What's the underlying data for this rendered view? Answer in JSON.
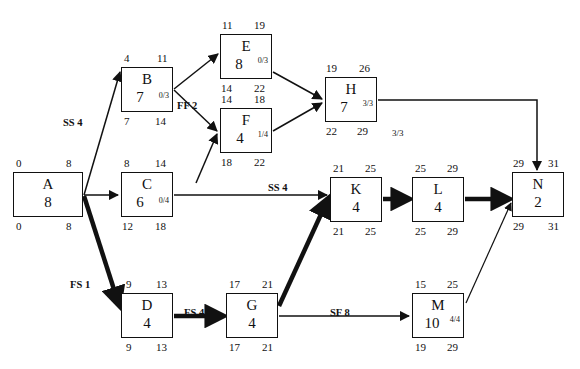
{
  "diagram": {
    "type": "precedence-network-diagram",
    "legend_note": "Each node box shows: Early Start (top-left), Early Finish (top-right), Activity ID, Duration, Free Float/Total Float (small), Late Start (bottom-left), Late Finish (bottom-right)"
  },
  "nodes": [
    {
      "id": "A",
      "name": "A",
      "duration": "8",
      "float": "",
      "es": "0",
      "ef": "8",
      "ls": "0",
      "lf": "8",
      "x": 13,
      "y": 172,
      "w": 70,
      "h": 45
    },
    {
      "id": "B",
      "name": "B",
      "duration": "7",
      "float": "0/3",
      "es": "4",
      "ef": "11",
      "ls": "7",
      "lf": "14",
      "x": 121,
      "y": 67,
      "w": 52,
      "h": 45
    },
    {
      "id": "C",
      "name": "C",
      "duration": "6",
      "float": "0/4",
      "es": "8",
      "ef": "14",
      "ls": "12",
      "lf": "18",
      "x": 121,
      "y": 172,
      "w": 52,
      "h": 45
    },
    {
      "id": "D",
      "name": "D",
      "duration": "4",
      "float": "",
      "es": "9",
      "ef": "13",
      "ls": "9",
      "lf": "13",
      "x": 121,
      "y": 293,
      "w": 52,
      "h": 45
    },
    {
      "id": "E",
      "name": "E",
      "duration": "8",
      "float": "0/3",
      "es": "11",
      "ef": "19",
      "ls": "14",
      "lf": "22",
      "x": 220,
      "y": 34,
      "w": 52,
      "h": 45
    },
    {
      "id": "F",
      "name": "F",
      "duration": "4",
      "float": "1/4",
      "es": "14",
      "ef": "18",
      "ls": "18",
      "lf": "22",
      "x": 220,
      "y": 108,
      "w": 52,
      "h": 45
    },
    {
      "id": "G",
      "name": "G",
      "duration": "4",
      "float": "",
      "es": "17",
      "ef": "21",
      "ls": "17",
      "lf": "21",
      "x": 226,
      "y": 293,
      "w": 52,
      "h": 45
    },
    {
      "id": "H",
      "name": "H",
      "duration": "7",
      "float": "3/3",
      "es": "19",
      "ef": "26",
      "ls": "22",
      "lf": "29",
      "x": 325,
      "y": 77,
      "w": 52,
      "h": 45
    },
    {
      "id": "K",
      "name": "K",
      "duration": "4",
      "float": "",
      "es": "21",
      "ef": "25",
      "ls": "21",
      "lf": "25",
      "x": 330,
      "y": 177,
      "w": 52,
      "h": 45
    },
    {
      "id": "L",
      "name": "L",
      "duration": "4",
      "float": "",
      "es": "25",
      "ef": "29",
      "ls": "25",
      "lf": "29",
      "x": 412,
      "y": 177,
      "w": 52,
      "h": 45
    },
    {
      "id": "M",
      "name": "M",
      "duration": "10",
      "float": "4/4",
      "es": "15",
      "ef": "25",
      "ls": "19",
      "lf": "29",
      "x": 412,
      "y": 293,
      "w": 52,
      "h": 45
    },
    {
      "id": "N",
      "name": "N",
      "duration": "2",
      "float": "",
      "es": "29",
      "ef": "31",
      "ls": "29",
      "lf": "31",
      "x": 512,
      "y": 172,
      "w": 52,
      "h": 45
    }
  ],
  "edge_labels": [
    {
      "key": "a_b",
      "text": "SS 4",
      "x": 63,
      "y": 117
    },
    {
      "key": "b_f",
      "text": "FF 2",
      "x": 177,
      "y": 100
    },
    {
      "key": "a_d",
      "text": "FS 1",
      "x": 70,
      "y": 279
    },
    {
      "key": "d_g",
      "text": "FS 4",
      "x": 184,
      "y": 307
    },
    {
      "key": "c_k",
      "text": "SS 4",
      "x": 268,
      "y": 182
    },
    {
      "key": "g_m",
      "text": "SF 8",
      "x": 330,
      "y": 307
    },
    {
      "key": "h_n",
      "text": "3/3",
      "x": 392,
      "y": 131,
      "plain": true
    }
  ],
  "edges": [
    {
      "from": "A",
      "to": "B",
      "critical": false,
      "label": "SS 4"
    },
    {
      "from": "A",
      "to": "C",
      "critical": false,
      "label": ""
    },
    {
      "from": "A",
      "to": "D",
      "critical": true,
      "label": "FS 1"
    },
    {
      "from": "B",
      "to": "E",
      "critical": false,
      "label": ""
    },
    {
      "from": "B",
      "to": "F",
      "critical": false,
      "label": "FF 2"
    },
    {
      "from": "C",
      "to": "F",
      "critical": false,
      "label": ""
    },
    {
      "from": "C",
      "to": "K",
      "critical": false,
      "label": "SS 4"
    },
    {
      "from": "E",
      "to": "H",
      "critical": false,
      "label": ""
    },
    {
      "from": "F",
      "to": "H",
      "critical": false,
      "label": ""
    },
    {
      "from": "H",
      "to": "N",
      "critical": false,
      "label": "3/3"
    },
    {
      "from": "D",
      "to": "G",
      "critical": true,
      "label": "FS 4"
    },
    {
      "from": "G",
      "to": "K",
      "critical": true,
      "label": ""
    },
    {
      "from": "G",
      "to": "M",
      "critical": false,
      "label": "SF 8"
    },
    {
      "from": "K",
      "to": "L",
      "critical": true,
      "label": ""
    },
    {
      "from": "L",
      "to": "N",
      "critical": true,
      "label": ""
    },
    {
      "from": "M",
      "to": "N",
      "critical": false,
      "label": ""
    }
  ],
  "colors": {
    "ink": "#111111",
    "background": "#ffffff"
  }
}
